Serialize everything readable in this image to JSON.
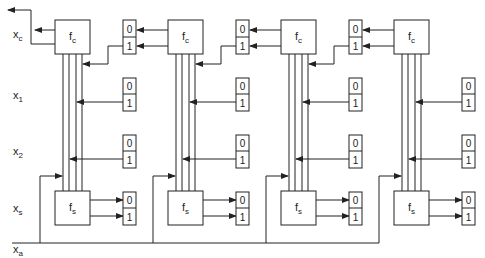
{
  "figure": {
    "row_labels": {
      "carry": {
        "main": "x",
        "sub": "c"
      },
      "input1": {
        "main": "x",
        "sub": "1"
      },
      "input2": {
        "main": "x",
        "sub": "2"
      },
      "sum": {
        "main": "x",
        "sub": "s"
      },
      "add": {
        "main": "x",
        "sub": "a"
      }
    },
    "columns": [
      {
        "fc": {
          "main": "f",
          "sub": "c"
        },
        "fs": {
          "main": "f",
          "sub": "s"
        },
        "carry_register": [
          "0",
          "1"
        ],
        "input1_register": [
          "0",
          "1"
        ],
        "input2_register": [
          "0",
          "1"
        ],
        "sum_register": [
          "0",
          "1"
        ]
      },
      {
        "fc": {
          "main": "f",
          "sub": "c"
        },
        "fs": {
          "main": "f",
          "sub": "s"
        },
        "carry_register": [
          "0",
          "1"
        ],
        "input1_register": [
          "0",
          "1"
        ],
        "input2_register": [
          "0",
          "1"
        ],
        "sum_register": [
          "0",
          "1"
        ]
      },
      {
        "fc": {
          "main": "f",
          "sub": "c"
        },
        "fs": {
          "main": "f",
          "sub": "s"
        },
        "carry_register": [
          "0",
          "1"
        ],
        "input1_register": [
          "0",
          "1"
        ],
        "input2_register": [
          "0",
          "1"
        ],
        "sum_register": [
          "0",
          "1"
        ]
      },
      {
        "fc": {
          "main": "f",
          "sub": "c"
        },
        "fs": {
          "main": "f",
          "sub": "s"
        },
        "input1_register": [
          "0",
          "1"
        ],
        "input2_register": [
          "0",
          "1"
        ],
        "sum_register": [
          "0",
          "1"
        ]
      }
    ],
    "colors": {
      "line": "#222222",
      "background": "#ffffff"
    }
  }
}
